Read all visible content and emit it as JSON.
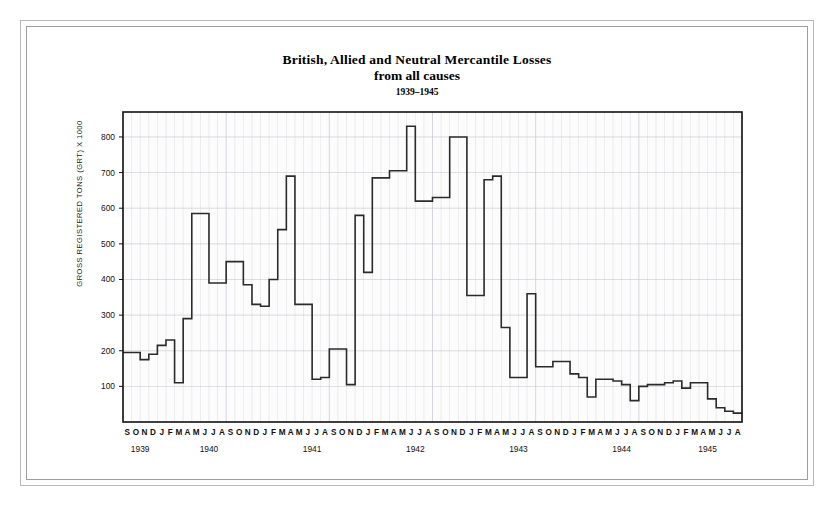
{
  "figure": {
    "title_line1": "British, Allied and Neutral Mercantile Losses",
    "title_line2": "from all causes",
    "title_line3": "1939–1945"
  },
  "chart_data": {
    "type": "line",
    "subtype": "step",
    "title": "British, Allied and Neutral Mercantile Losses from all causes",
    "subtitle": "1939–1945",
    "xlabel": "",
    "ylabel": "GROSS REGISTERED TONS (GRT) X 1000",
    "ylim": [
      0,
      870
    ],
    "yticks": [
      100,
      200,
      300,
      400,
      500,
      600,
      700,
      800
    ],
    "grid": true,
    "legend": null,
    "line_color": "#2b2b2b",
    "grid_color": "#c8c8d2",
    "axis_color": "#111111",
    "plot_background": "#fcfcfc",
    "x_month_labels": [
      "S",
      "O",
      "N",
      "D",
      "J",
      "F",
      "M",
      "A",
      "M",
      "J",
      "J",
      "A",
      "S",
      "O",
      "N",
      "D",
      "J",
      "F",
      "M",
      "A",
      "M",
      "J",
      "J",
      "A",
      "S",
      "O",
      "N",
      "D",
      "J",
      "F",
      "M",
      "A",
      "M",
      "J",
      "J",
      "A",
      "S",
      "O",
      "N",
      "D",
      "J",
      "F",
      "M",
      "A",
      "M",
      "J",
      "J",
      "A",
      "S",
      "O",
      "N",
      "D",
      "J",
      "F",
      "M",
      "A",
      "M",
      "J",
      "J",
      "A",
      "S",
      "O",
      "N",
      "D",
      "J",
      "F",
      "M",
      "A",
      "M",
      "J",
      "J",
      "A"
    ],
    "year_labels": [
      "1939",
      "1940",
      "1941",
      "1942",
      "1943",
      "1944",
      "1945"
    ],
    "year_label_first_index": [
      0,
      4,
      16,
      28,
      40,
      52,
      64
    ],
    "year_label_span": [
      4,
      12,
      12,
      12,
      12,
      12,
      8
    ],
    "categories": [
      "1939-09",
      "1939-10",
      "1939-11",
      "1939-12",
      "1940-01",
      "1940-02",
      "1940-03",
      "1940-04",
      "1940-05",
      "1940-06",
      "1940-07",
      "1940-08",
      "1940-09",
      "1940-10",
      "1940-11",
      "1940-12",
      "1941-01",
      "1941-02",
      "1941-03",
      "1941-04",
      "1941-05",
      "1941-06",
      "1941-07",
      "1941-08",
      "1941-09",
      "1941-10",
      "1941-11",
      "1941-12",
      "1942-01",
      "1942-02",
      "1942-03",
      "1942-04",
      "1942-05",
      "1942-06",
      "1942-07",
      "1942-08",
      "1942-09",
      "1942-10",
      "1942-11",
      "1942-12",
      "1943-01",
      "1943-02",
      "1943-03",
      "1943-04",
      "1943-05",
      "1943-06",
      "1943-07",
      "1943-08",
      "1943-09",
      "1943-10",
      "1943-11",
      "1943-12",
      "1944-01",
      "1944-02",
      "1944-03",
      "1944-04",
      "1944-05",
      "1944-06",
      "1944-07",
      "1944-08",
      "1944-09",
      "1944-10",
      "1944-11",
      "1944-12",
      "1945-01",
      "1945-02",
      "1945-03",
      "1945-04",
      "1945-05",
      "1945-06",
      "1945-07",
      "1945-08"
    ],
    "values": [
      195,
      195,
      175,
      190,
      215,
      230,
      110,
      290,
      585,
      585,
      390,
      390,
      450,
      450,
      385,
      330,
      325,
      400,
      540,
      690,
      330,
      330,
      120,
      125,
      205,
      205,
      105,
      580,
      420,
      685,
      685,
      705,
      705,
      830,
      620,
      620,
      630,
      630,
      800,
      800,
      355,
      355,
      680,
      690,
      265,
      125,
      125,
      360,
      155,
      155,
      170,
      170,
      135,
      125,
      70,
      120,
      120,
      115,
      105,
      60,
      100,
      105,
      105,
      110,
      115,
      95,
      110,
      110,
      65,
      40,
      30,
      25
    ]
  }
}
